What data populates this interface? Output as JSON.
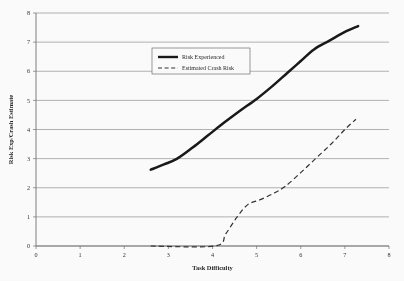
{
  "chart_data": {
    "type": "line",
    "title": "",
    "xlabel": "Task Difficulty",
    "ylabel": "Risk Exp/Crash Estimate",
    "xlim": [
      0,
      8
    ],
    "ylim": [
      0,
      8
    ],
    "xticks": [
      "0",
      "1",
      "2",
      "3",
      "4",
      "5",
      "6",
      "7",
      "8"
    ],
    "yticks": [
      "0",
      "1",
      "2",
      "3",
      "4",
      "5",
      "6",
      "7",
      "8"
    ],
    "grid": "horizontal",
    "legend_position": "upper-left-inset",
    "series": [
      {
        "name": "Risk Experienced",
        "style": "solid",
        "color": "#111111",
        "points": [
          [
            2.6,
            2.62
          ],
          [
            2.9,
            2.8
          ],
          [
            3.2,
            3.0
          ],
          [
            3.55,
            3.38
          ],
          [
            3.9,
            3.8
          ],
          [
            4.25,
            4.22
          ],
          [
            4.6,
            4.62
          ],
          [
            5.0,
            5.05
          ],
          [
            5.35,
            5.48
          ],
          [
            5.7,
            5.95
          ],
          [
            6.0,
            6.35
          ],
          [
            6.3,
            6.75
          ],
          [
            6.65,
            7.05
          ],
          [
            7.0,
            7.35
          ],
          [
            7.3,
            7.55
          ]
        ]
      },
      {
        "name": "Estimated Crash Risk",
        "style": "dashed",
        "color": "#2a2a2a",
        "points": [
          [
            2.6,
            0.0
          ],
          [
            4.05,
            0.0
          ],
          [
            4.3,
            0.42
          ],
          [
            4.55,
            0.98
          ],
          [
            4.8,
            1.42
          ],
          [
            5.1,
            1.6
          ],
          [
            5.4,
            1.82
          ],
          [
            5.65,
            2.05
          ],
          [
            6.0,
            2.52
          ],
          [
            6.35,
            3.02
          ],
          [
            6.7,
            3.52
          ],
          [
            7.0,
            4.0
          ],
          [
            7.25,
            4.35
          ]
        ]
      }
    ]
  },
  "axis": {
    "x_title": "Task Difficulty",
    "y_title": "Risk Exp/Crash Estimate"
  },
  "legend": {
    "entries": [
      {
        "label": "Risk Experienced"
      },
      {
        "label": "Estimated Crash Risk"
      }
    ]
  }
}
